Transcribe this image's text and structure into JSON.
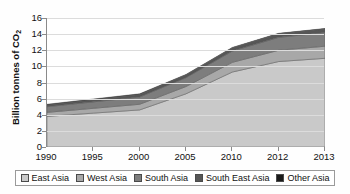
{
  "chart_data": {
    "type": "area",
    "title": "",
    "subtitle": "",
    "xlabel": "",
    "ylabel": "Billion tonnes of CO2",
    "ylabel_text": "Billion tonnes of CO",
    "ylabel_sub": "2",
    "categories": [
      "1990",
      "1995",
      "2000",
      "2005",
      "2010",
      "2012",
      "2013"
    ],
    "ylim": [
      0,
      16
    ],
    "yticks": [
      0,
      2,
      4,
      6,
      8,
      10,
      12,
      14,
      16
    ],
    "grid": true,
    "legend_position": "bottom",
    "stacked": true,
    "series": [
      {
        "name": "East Asia",
        "color": "#c9c9c9",
        "values": [
          3.8,
          4.2,
          4.6,
          6.6,
          9.3,
          10.6,
          11.0
        ]
      },
      {
        "name": "West Asia",
        "color": "#a8a8a8",
        "values": [
          0.5,
          0.6,
          0.7,
          0.9,
          1.2,
          1.4,
          1.5
        ]
      },
      {
        "name": "South Asia",
        "color": "#7d7d7d",
        "values": [
          0.7,
          0.8,
          0.9,
          1.1,
          1.4,
          1.6,
          1.7
        ]
      },
      {
        "name": "South East Asia",
        "color": "#565656",
        "values": [
          0.2,
          0.25,
          0.3,
          0.35,
          0.4,
          0.45,
          0.45
        ]
      },
      {
        "name": "Other Asia",
        "color": "#1a1a1a",
        "values": [
          0.1,
          0.1,
          0.1,
          0.05,
          0.05,
          0.05,
          0.05
        ]
      }
    ],
    "totals": [
      5.3,
      5.95,
      6.6,
      9.0,
      12.35,
      14.1,
      14.7
    ]
  },
  "legend": {
    "items": [
      {
        "label": "East Asia"
      },
      {
        "label": "West Asia"
      },
      {
        "label": "South Asia"
      },
      {
        "label": "South East Asia"
      },
      {
        "label": "Other Asia"
      }
    ]
  }
}
